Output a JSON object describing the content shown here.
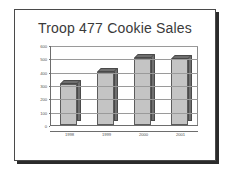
{
  "slide": {
    "title": "Troop 477 Cookie Sales"
  },
  "colors": {
    "frame": "#4a4a4a",
    "frame_shadow": "#2b2b2b",
    "canvas": "#ffffff",
    "bar_front": "#c4c4c4",
    "bar_shade": "#6f6f6f",
    "bar_outline": "#5c5c5c",
    "gridline": "#9a9a9a",
    "axis": "#6d6d6d",
    "text": "#555555",
    "title_text": "#3a3a3a"
  },
  "chart_data": {
    "type": "bar",
    "title": "Troop 477 Cookie Sales",
    "xlabel": "",
    "ylabel": "",
    "categories": [
      "1998",
      "1999",
      "2000",
      "2001"
    ],
    "values": [
      310,
      400,
      505,
      495
    ],
    "series": [
      {
        "name": "Cookie Sales",
        "values": [
          310,
          400,
          505,
          495
        ]
      }
    ],
    "ylim": [
      0,
      600
    ],
    "ytick_step": 100,
    "yticks": [
      0,
      100,
      200,
      300,
      400,
      500,
      600
    ],
    "ytick_labels": [
      "0",
      "100",
      "200",
      "300",
      "400",
      "500",
      "600"
    ],
    "grid": true,
    "grid_axis": "y",
    "legend": false,
    "legend_position": "none",
    "style": "3d-column",
    "annotations": []
  }
}
